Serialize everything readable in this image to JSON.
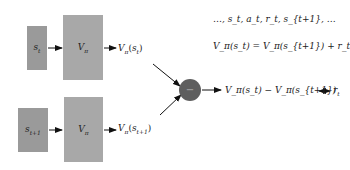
{
  "diagram": {
    "top_row": {
      "input": {
        "base": "s",
        "sub": "t"
      },
      "network": {
        "base": "V",
        "sub": "π"
      },
      "output": {
        "pre": "V",
        "pre_sub": "π",
        "arg": "s",
        "arg_sub": "t"
      }
    },
    "bottom_row": {
      "input": {
        "base": "s",
        "sub": "t+1"
      },
      "network": {
        "base": "V",
        "sub": "π"
      },
      "output": {
        "pre": "V",
        "pre_sub": "π",
        "arg": "s",
        "arg_sub": "t+1"
      }
    },
    "operator": {
      "symbol": "−",
      "name": "subtraction"
    },
    "sequence": "…, s_t, a_t, r_t, s_{t+1}, …",
    "equation": "V_π(s_t) = V_π(s_{t+1}) + r_t",
    "difference_output": "V_π(s_t) − V_π(s_{t+1})",
    "target": {
      "base": "r",
      "sub": "t"
    },
    "colors": {
      "input_box": "#9a9a9a",
      "network_box": "#a8a8a8",
      "operator_circle": "#5e5e5e",
      "arrows": "#111111"
    }
  }
}
